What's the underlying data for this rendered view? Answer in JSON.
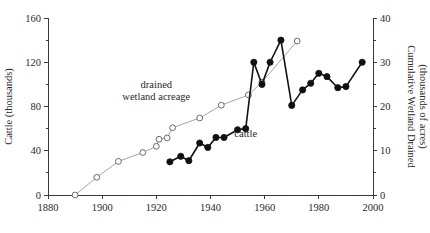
{
  "chart_data": {
    "type": "line",
    "title": "",
    "xlabel": "",
    "xlim": [
      1880,
      2000
    ],
    "x_ticks": [
      1880,
      1900,
      1920,
      1940,
      1960,
      1980,
      2000
    ],
    "grid": false,
    "legend_position": "inline-annotations",
    "axes": {
      "left": {
        "label": "Cattle (thousands)",
        "lim": [
          0,
          160
        ],
        "ticks": [
          0,
          40,
          80,
          120,
          160
        ],
        "minor_ticks": [
          20,
          60,
          100,
          140
        ]
      },
      "right": {
        "label_line1": "Cumulative Wetland Drained",
        "label_line2": "(thousands of acres)",
        "lim": [
          0,
          40
        ],
        "ticks": [
          0,
          10,
          20,
          30,
          40
        ],
        "minor_ticks": [
          5,
          15,
          25,
          35
        ]
      }
    },
    "annotations": [
      {
        "name": "drained-wetland-acreage",
        "line1": "drained",
        "line2": "wetland acreage",
        "x": 1920,
        "y_left": 97
      },
      {
        "name": "cattle",
        "text": "cattle",
        "x": 1953,
        "y_left": 52
      }
    ],
    "series": [
      {
        "name": "drained wetland acreage",
        "axis": "right",
        "marker": "open-circle",
        "unit": "thousands of acres",
        "points": [
          {
            "x": 1890,
            "y": 0.0
          },
          {
            "x": 1898,
            "y": 4.0
          },
          {
            "x": 1906,
            "y": 7.6
          },
          {
            "x": 1915,
            "y": 9.6
          },
          {
            "x": 1920,
            "y": 11.0
          },
          {
            "x": 1921,
            "y": 12.6
          },
          {
            "x": 1924,
            "y": 12.9
          },
          {
            "x": 1926,
            "y": 15.2
          },
          {
            "x": 1936,
            "y": 17.4
          },
          {
            "x": 1944,
            "y": 20.3
          },
          {
            "x": 1954,
            "y": 22.6
          },
          {
            "x": 1959,
            "y": 25.5
          },
          {
            "x": 1972,
            "y": 34.8
          }
        ]
      },
      {
        "name": "cattle",
        "axis": "left",
        "marker": "filled-circle",
        "unit": "thousands",
        "points": [
          {
            "x": 1925,
            "y": 30
          },
          {
            "x": 1929,
            "y": 35
          },
          {
            "x": 1932,
            "y": 31
          },
          {
            "x": 1936,
            "y": 47
          },
          {
            "x": 1939,
            "y": 43
          },
          {
            "x": 1942,
            "y": 52
          },
          {
            "x": 1945,
            "y": 52
          },
          {
            "x": 1950,
            "y": 59
          },
          {
            "x": 1953,
            "y": 60
          },
          {
            "x": 1956,
            "y": 120
          },
          {
            "x": 1959,
            "y": 100
          },
          {
            "x": 1962,
            "y": 120
          },
          {
            "x": 1966,
            "y": 140
          },
          {
            "x": 1970,
            "y": 81
          },
          {
            "x": 1974,
            "y": 95
          },
          {
            "x": 1977,
            "y": 101
          },
          {
            "x": 1980,
            "y": 110
          },
          {
            "x": 1983,
            "y": 107
          },
          {
            "x": 1987,
            "y": 97
          },
          {
            "x": 1990,
            "y": 98
          },
          {
            "x": 1996,
            "y": 120
          }
        ]
      }
    ]
  }
}
